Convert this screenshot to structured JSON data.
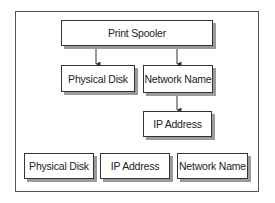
{
  "diagram": {
    "type": "dependency-tree",
    "nodes": [
      {
        "id": "print_spooler",
        "label": "Print Spooler"
      },
      {
        "id": "physical_disk_1",
        "label": "Physical Disk"
      },
      {
        "id": "network_name_1",
        "label": "Network Name"
      },
      {
        "id": "ip_address_1",
        "label": "IP Address"
      },
      {
        "id": "physical_disk_2",
        "label": "Physical Disk"
      },
      {
        "id": "ip_address_2",
        "label": "IP Address"
      },
      {
        "id": "network_name_2",
        "label": "Network Name"
      }
    ],
    "edges": [
      {
        "from": "print_spooler",
        "to": "physical_disk_1"
      },
      {
        "from": "print_spooler",
        "to": "network_name_1"
      },
      {
        "from": "network_name_1",
        "to": "ip_address_1"
      }
    ],
    "colors": {
      "border": "#333333",
      "shadow": "#9a9a9a",
      "frame": "#555555",
      "text": "#222222"
    }
  }
}
